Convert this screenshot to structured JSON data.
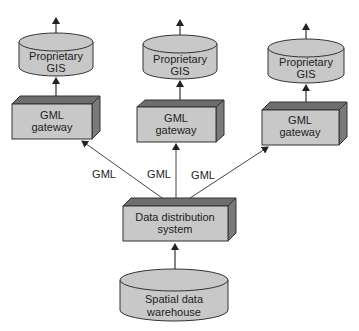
{
  "diagram": {
    "colors": {
      "fill": "#c8c8c8",
      "top": "#6e6e6e",
      "side": "#7a7a7a",
      "stroke": "#333333",
      "line": "#444444"
    },
    "gis_nodes": [
      {
        "line1": "Proprietary",
        "line2": "GIS"
      },
      {
        "line1": "Proprietary",
        "line2": "GIS"
      },
      {
        "line1": "Proprietary",
        "line2": "GIS"
      }
    ],
    "gateways": [
      {
        "line1": "GML",
        "line2": "gateway"
      },
      {
        "line1": "GML",
        "line2": "gateway"
      },
      {
        "line1": "GML",
        "line2": "gateway"
      }
    ],
    "edge_labels": [
      "GML",
      "GML",
      "GML"
    ],
    "distribution": {
      "line1": "Data distribution",
      "line2": "system"
    },
    "warehouse": {
      "line1": "Spatial data",
      "line2": "warehouse"
    }
  }
}
